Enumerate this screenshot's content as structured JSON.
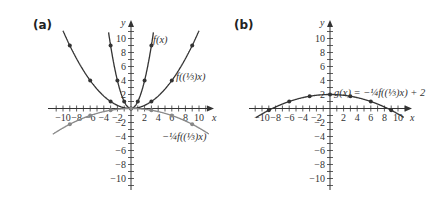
{
  "figure": {
    "panels": [
      {
        "label": "(a)"
      },
      {
        "label": "(b)"
      }
    ]
  },
  "chart_data": [
    {
      "type": "line",
      "panel": "(a)",
      "title": "",
      "xlabel": "x",
      "ylabel": "y",
      "xlim": [
        -10,
        10
      ],
      "ylim": [
        -10,
        10
      ],
      "xticks": [
        -10,
        -8,
        -6,
        -4,
        -2,
        2,
        4,
        6,
        8,
        10
      ],
      "yticks": [
        -10,
        -8,
        -6,
        -4,
        -2,
        2,
        4,
        6,
        8,
        10
      ],
      "grid": false,
      "series": [
        {
          "name": "f(x)",
          "label_display": "f(x)",
          "formula": "x^2",
          "color": "#333333",
          "points": [
            [
              -3,
              9
            ],
            [
              -2,
              4
            ],
            [
              -1,
              1
            ],
            [
              0,
              0
            ],
            [
              1,
              1
            ],
            [
              2,
              4
            ],
            [
              3,
              9
            ]
          ]
        },
        {
          "name": "f((1/3)x)",
          "label_display": "f((⅓)x)",
          "formula": "(x/3)^2",
          "color": "#333333",
          "points": [
            [
              -9,
              9
            ],
            [
              -6,
              4
            ],
            [
              -3,
              1
            ],
            [
              0,
              0
            ],
            [
              3,
              1
            ],
            [
              6,
              4
            ],
            [
              9,
              9
            ]
          ]
        },
        {
          "name": "-1/4 f((1/3)x)",
          "label_display": "−¼f((⅓)x)",
          "formula": "-(x/3)^2/4",
          "color": "#888888",
          "points": [
            [
              -9,
              -2.25
            ],
            [
              -6,
              -1
            ],
            [
              -3,
              -0.25
            ],
            [
              0,
              0
            ],
            [
              3,
              -0.25
            ],
            [
              6,
              -1
            ],
            [
              9,
              -2.25
            ]
          ]
        }
      ]
    },
    {
      "type": "line",
      "panel": "(b)",
      "title": "",
      "xlabel": "x",
      "ylabel": "y",
      "xlim": [
        -10,
        10
      ],
      "ylim": [
        -10,
        10
      ],
      "xticks": [
        -10,
        -8,
        -6,
        -4,
        -2,
        2,
        4,
        6,
        8,
        10
      ],
      "yticks": [
        -10,
        -8,
        -6,
        -4,
        -2,
        2,
        4,
        6,
        8,
        10
      ],
      "grid": false,
      "series": [
        {
          "name": "g(x) = -1/4 f((1/3)x) + 2",
          "label_display": "g(x) = −¼f((⅓)x) + 2",
          "formula": "-(x/3)^2/4 + 2",
          "color": "#333333",
          "points": [
            [
              -9,
              -0.25
            ],
            [
              -6,
              1
            ],
            [
              -3,
              1.75
            ],
            [
              0,
              2
            ],
            [
              3,
              1.75
            ],
            [
              6,
              1
            ],
            [
              9,
              -0.25
            ]
          ]
        }
      ]
    }
  ]
}
